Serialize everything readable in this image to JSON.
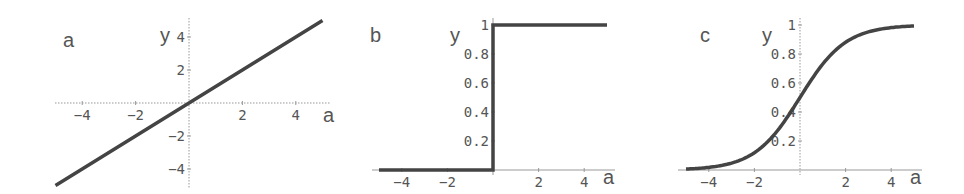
{
  "chart_data": [
    {
      "type": "line",
      "panel_label": "a",
      "title": "",
      "xlabel": "a",
      "ylabel": "y",
      "xlim": [
        -5,
        5
      ],
      "ylim": [
        -5,
        5
      ],
      "x_ticks": [
        "-4",
        "-2",
        "2",
        "4"
      ],
      "y_ticks": [
        "4",
        "2",
        "-2",
        "-4"
      ],
      "grid": false,
      "series": [
        {
          "name": "linear",
          "function": "y = a",
          "x": [
            -5,
            -4,
            -2,
            0,
            2,
            4,
            5
          ],
          "y": [
            -5,
            -4,
            -2,
            0,
            2,
            4,
            5
          ]
        }
      ]
    },
    {
      "type": "line",
      "panel_label": "b",
      "title": "",
      "xlabel": "a",
      "ylabel": "y",
      "xlim": [
        -5,
        5
      ],
      "ylim": [
        0,
        1
      ],
      "x_ticks": [
        "-4",
        "-2",
        "2",
        "4"
      ],
      "y_ticks": [
        "1",
        "0.8",
        "0.6",
        "0.4",
        "0.2"
      ],
      "grid": false,
      "series": [
        {
          "name": "step",
          "function": "y = 0 for a<0, 1 for a>=0",
          "x": [
            -5,
            -4,
            -2,
            0,
            0,
            2,
            4,
            5
          ],
          "y": [
            0,
            0,
            0,
            0,
            1,
            1,
            1,
            1
          ]
        }
      ]
    },
    {
      "type": "line",
      "panel_label": "c",
      "title": "",
      "xlabel": "a",
      "ylabel": "y",
      "xlim": [
        -5,
        5
      ],
      "ylim": [
        0,
        1
      ],
      "x_ticks": [
        "-4",
        "-2",
        "2",
        "4"
      ],
      "y_ticks": [
        "1",
        "0.8",
        "0.6",
        "0.4",
        "0.2"
      ],
      "grid": false,
      "series": [
        {
          "name": "sigmoid",
          "function": "y = 1/(1+e^-a)",
          "x": [
            -5,
            -4,
            -3,
            -2,
            -1,
            0,
            1,
            2,
            3,
            4,
            5
          ],
          "y": [
            0.007,
            0.018,
            0.047,
            0.119,
            0.269,
            0.5,
            0.731,
            0.881,
            0.953,
            0.982,
            0.993
          ]
        }
      ]
    }
  ]
}
